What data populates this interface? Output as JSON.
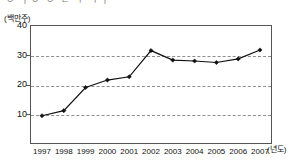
{
  "page": {
    "cut_off_caption": "ㅇ ㅏㅇ   ㅇ ㄴ  ㅜ  ㅜㅏ",
    "unit_label": "(백만주)",
    "xaxis_unit": "(년도)"
  },
  "chart_data": {
    "type": "line",
    "title": "",
    "subtitle": "",
    "xlabel": "(년도)",
    "ylabel": "(백만주)",
    "categories": [
      "1997",
      "1998",
      "1999",
      "2000",
      "2001",
      "2002",
      "2003",
      "2004",
      "2005",
      "2006",
      "2007"
    ],
    "values": [
      9.5,
      11.2,
      19.0,
      21.5,
      22.6,
      31.4,
      28.2,
      27.9,
      27.4,
      28.6,
      31.6
    ],
    "series": [
      {
        "name": "주식수",
        "values": [
          9.5,
          11.2,
          19.0,
          21.5,
          22.6,
          31.4,
          28.2,
          27.9,
          27.4,
          28.6,
          31.6
        ]
      }
    ],
    "ylim": [
      0,
      40
    ],
    "yticks": [
      10,
      20,
      30,
      40
    ],
    "ytick_labels": [
      "10",
      "20",
      "30",
      "40"
    ],
    "grid": true,
    "grid_style": "dashed-horizontal",
    "gridlines_at": [
      10,
      20,
      30
    ],
    "legend": false,
    "legend_position": "none",
    "marker": "diamond",
    "line_color": "#111111",
    "marker_color": "#111111"
  },
  "colors": {
    "line": "#111111",
    "marker": "#111111",
    "grid": "#8e8e8e",
    "frame": "#555555",
    "background": "#ffffff",
    "text": "#111111"
  }
}
